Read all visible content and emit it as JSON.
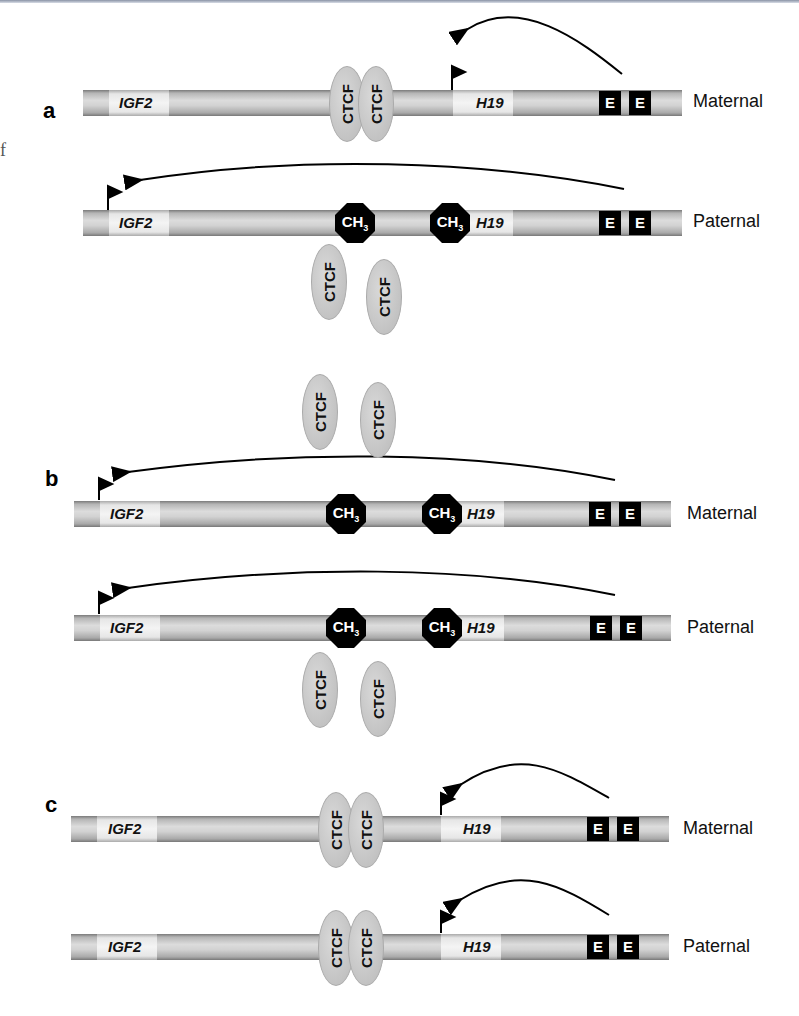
{
  "figure": {
    "stray_text": "f",
    "panels": [
      {
        "label": "a",
        "rows": [
          {
            "allele": "Maternal",
            "genes": [
              "IGF2",
              "H19"
            ],
            "active_promoter": "H19",
            "ctcf_bound": true,
            "methylation": [],
            "enhancers": [
              "E",
              "E"
            ]
          },
          {
            "allele": "Paternal",
            "genes": [
              "IGF2",
              "H19"
            ],
            "active_promoter": "IGF2",
            "ctcf_bound": false,
            "methylation": [
              "CH3",
              "CH3"
            ],
            "unbound_ctcf": [
              "CTCF",
              "CTCF"
            ],
            "enhancers": [
              "E",
              "E"
            ]
          }
        ]
      },
      {
        "label": "b",
        "rows": [
          {
            "allele": "Maternal",
            "genes": [
              "IGF2",
              "H19"
            ],
            "active_promoter": "IGF2",
            "ctcf_bound": false,
            "methylation": [
              "CH3",
              "CH3"
            ],
            "unbound_ctcf": [
              "CTCF",
              "CTCF"
            ],
            "enhancers": [
              "E",
              "E"
            ]
          },
          {
            "allele": "Paternal",
            "genes": [
              "IGF2",
              "H19"
            ],
            "active_promoter": "IGF2",
            "ctcf_bound": false,
            "methylation": [
              "CH3",
              "CH3"
            ],
            "unbound_ctcf": [
              "CTCF",
              "CTCF"
            ],
            "enhancers": [
              "E",
              "E"
            ]
          }
        ]
      },
      {
        "label": "c",
        "rows": [
          {
            "allele": "Maternal",
            "genes": [
              "IGF2",
              "H19"
            ],
            "active_promoter": "H19",
            "ctcf_bound": true,
            "methylation": [],
            "enhancers": [
              "E",
              "E"
            ]
          },
          {
            "allele": "Paternal",
            "genes": [
              "IGF2",
              "H19"
            ],
            "active_promoter": "H19",
            "ctcf_bound": true,
            "methylation": [],
            "enhancers": [
              "E",
              "E"
            ]
          }
        ]
      }
    ],
    "labels": {
      "igf2": "IGF2",
      "h19": "H19",
      "ctcf": "CTCF",
      "ch3_base": "CH",
      "ch3_sub": "3",
      "enhancer": "E",
      "maternal": "Maternal",
      "paternal": "Paternal"
    }
  }
}
